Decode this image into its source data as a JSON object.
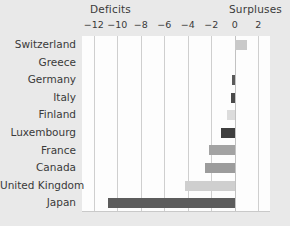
{
  "chart": {
    "type": "bar",
    "orientation": "horizontal",
    "deficits_label": "Deficits",
    "surpluses_label": "Surpluses"
  },
  "axis": {
    "ticks": [
      {
        "label": "−12",
        "value": -12
      },
      {
        "label": "−10",
        "value": -10
      },
      {
        "label": "−8",
        "value": -8
      },
      {
        "label": "−6",
        "value": -6
      },
      {
        "label": "−4",
        "value": -4
      },
      {
        "label": "−2",
        "value": -2
      },
      {
        "label": "0",
        "value": 0
      },
      {
        "label": "2",
        "value": 2
      }
    ],
    "min": -13,
    "max": 3
  },
  "chart_data": {
    "type": "bar",
    "orientation": "horizontal",
    "title": "",
    "xlabel": "",
    "ylabel": "",
    "xlim": [
      -13,
      3
    ],
    "grid": true,
    "legend": "none",
    "annotations": [
      "Deficits",
      "Surpluses"
    ],
    "categories": [
      "Switzerland",
      "Greece",
      "Germany",
      "Italy",
      "Finland",
      "Luxembourg",
      "France",
      "Canada",
      "United Kingdom",
      "Japan"
    ],
    "values": [
      1.0,
      0.0,
      -0.25,
      -0.3,
      -0.65,
      -1.15,
      -2.2,
      -2.5,
      -4.2,
      -10.8
    ],
    "colors": [
      "#c9c9c9",
      "#c9c9c9",
      "#5a5a5a",
      "#4a4a4a",
      "#dcdcdc",
      "#3f3f3f",
      "#a3a3a3",
      "#9c9c9c",
      "#cfcfcf",
      "#5c5c5c"
    ]
  },
  "rows": [
    {
      "label": "Switzerland",
      "value": 1.0,
      "color": "#c9c9c9"
    },
    {
      "label": "Greece",
      "value": 0.0,
      "color": "#c9c9c9"
    },
    {
      "label": "Germany",
      "value": -0.25,
      "color": "#5a5a5a"
    },
    {
      "label": "Italy",
      "value": -0.3,
      "color": "#4a4a4a"
    },
    {
      "label": "Finland",
      "value": -0.65,
      "color": "#dcdcdc"
    },
    {
      "label": "Luxembourg",
      "value": -1.15,
      "color": "#3f3f3f"
    },
    {
      "label": "France",
      "value": -2.2,
      "color": "#a3a3a3"
    },
    {
      "label": "Canada",
      "value": -2.5,
      "color": "#9c9c9c"
    },
    {
      "label": "United Kingdom",
      "value": -4.2,
      "color": "#cfcfcf"
    },
    {
      "label": "Japan",
      "value": -10.8,
      "color": "#5c5c5c"
    }
  ]
}
